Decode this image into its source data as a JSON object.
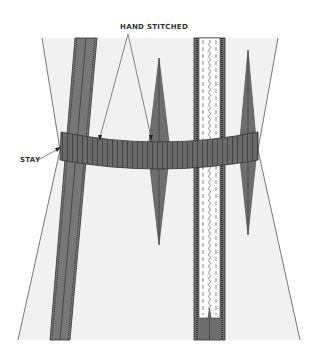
{
  "diagram": {
    "labels": {
      "hand_stitched": "HAND STITCHED",
      "stay": "STAY"
    },
    "colors": {
      "fabric": "#f1f1f1",
      "outline": "#555555",
      "seam_allowance": "#777777",
      "dart": "#6e6e6e",
      "stay": "#6a6a6a",
      "zipper_tape": "#ffffff",
      "text": "#333333"
    },
    "parts": [
      "panel",
      "seam",
      "left-dart",
      "zipper",
      "right-dart",
      "stay-band"
    ]
  }
}
